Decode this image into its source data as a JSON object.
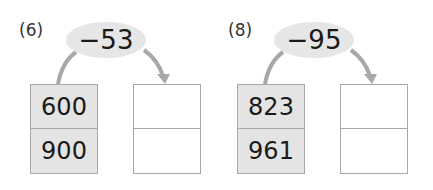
{
  "problems": [
    {
      "label": "(6)",
      "operation": "−53",
      "inputs": [
        "600",
        "900"
      ],
      "outputs": [
        "",
        ""
      ]
    },
    {
      "label": "(8)",
      "operation": "−95",
      "inputs": [
        "823",
        "961"
      ],
      "outputs": [
        "",
        ""
      ]
    }
  ],
  "colors": {
    "oval": "#e6e6e6",
    "arrow": "#a8a8a8",
    "input_box": "#e4e4e4",
    "border": "#a8a8a8"
  }
}
